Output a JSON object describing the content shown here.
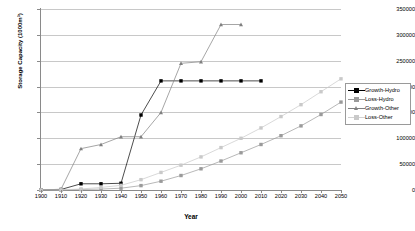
{
  "chart_data": {
    "type": "line",
    "title": "",
    "xlabel": "Year",
    "ylabel": "Storage Capacity (1000m³)",
    "xlim": [
      1900,
      2050
    ],
    "ylim": [
      0,
      350000
    ],
    "xticks": [
      1900,
      1910,
      1920,
      1930,
      1940,
      1950,
      1960,
      1970,
      1980,
      1990,
      2000,
      2010,
      2020,
      2030,
      2040,
      2050
    ],
    "yticks": [
      0,
      50000,
      100000,
      150000,
      200000,
      250000,
      300000,
      350000
    ],
    "grid": "horizontal",
    "legend_position": "right",
    "series": [
      {
        "name": "Growth-Hydro",
        "marker": "square",
        "color": "#000000",
        "x": [
          1900,
          1910,
          1920,
          1930,
          1940,
          1950,
          1960,
          1970,
          1980,
          1990,
          2000,
          2010
        ],
        "y": [
          0,
          1000,
          12000,
          12000,
          13000,
          145000,
          211000,
          211000,
          211000,
          211000,
          211000,
          211000
        ]
      },
      {
        "name": "Loss-Hydro",
        "marker": "square",
        "color": "#9a9a9a",
        "x": [
          1900,
          1910,
          1920,
          1930,
          1940,
          1950,
          1960,
          1970,
          1980,
          1990,
          2000,
          2010,
          2020,
          2030,
          2040,
          2050
        ],
        "y": [
          0,
          200,
          900,
          1800,
          3500,
          8500,
          17000,
          28000,
          41000,
          56000,
          72000,
          88000,
          105000,
          124000,
          146000,
          170000
        ]
      },
      {
        "name": "Growth-Other",
        "marker": "triangle",
        "color": "#808080",
        "x": [
          1900,
          1910,
          1920,
          1930,
          1940,
          1950,
          1960,
          1970,
          1980,
          1990,
          2000
        ],
        "y": [
          0,
          1500,
          80000,
          88000,
          103000,
          103000,
          150000,
          245000,
          248000,
          320000,
          320000
        ]
      },
      {
        "name": "Loss-Other",
        "marker": "square",
        "color": "#c9c9c9",
        "x": [
          1900,
          1910,
          1920,
          1930,
          1940,
          1950,
          1960,
          1970,
          1980,
          1990,
          2000,
          2010,
          2020,
          2030,
          2040,
          2050
        ],
        "y": [
          0,
          300,
          2000,
          5000,
          9000,
          20000,
          34000,
          48000,
          64000,
          82000,
          100000,
          120000,
          142000,
          165000,
          190000,
          215000
        ]
      }
    ]
  },
  "legend": {
    "items": [
      {
        "label": "Growth-Hydro"
      },
      {
        "label": "Loss-Hydro"
      },
      {
        "label": "Growth-Other"
      },
      {
        "label": "Loss-Other"
      }
    ]
  }
}
